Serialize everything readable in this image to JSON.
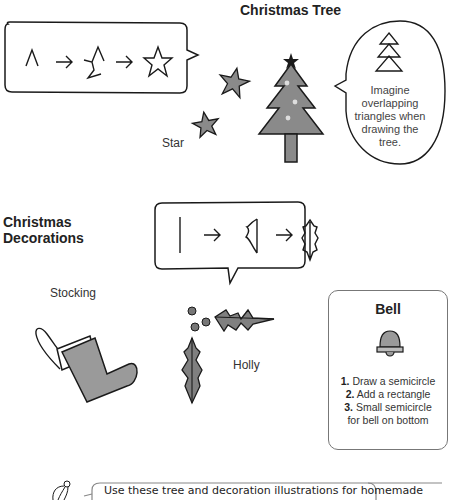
{
  "tree_section": {
    "title": "Christmas Tree",
    "star_steps_icons": [
      "caret-stroke",
      "arrow-right",
      "partial-star",
      "arrow-right",
      "star-outline"
    ],
    "star_label": "Star",
    "tip_bubble_text": "Imagine overlapping triangles when drawing the tree."
  },
  "decorations_section": {
    "title_line1": "Christmas",
    "title_line2": "Decorations",
    "holly_steps_icons": [
      "vertical-line",
      "arrow-right",
      "half-leaf",
      "arrow-right",
      "holly-leaf-outline"
    ],
    "stocking_label": "Stocking",
    "holly_label": "Holly",
    "bell_card": {
      "title": "Bell",
      "steps": [
        {
          "num": "1.",
          "text": "Draw a semicircle"
        },
        {
          "num": "2.",
          "text": "Add a rectangle"
        },
        {
          "num": "3.",
          "text": "Small semicircle"
        },
        {
          "num": "",
          "text": "for bell on bottom"
        }
      ]
    }
  },
  "footer_tip": {
    "text": "Use these tree and decoration illustrations for homemade"
  },
  "colors": {
    "fill_gray": "#8a8a8a",
    "light_fill": "#a8a8a8",
    "stroke": "#1a1a1a"
  }
}
